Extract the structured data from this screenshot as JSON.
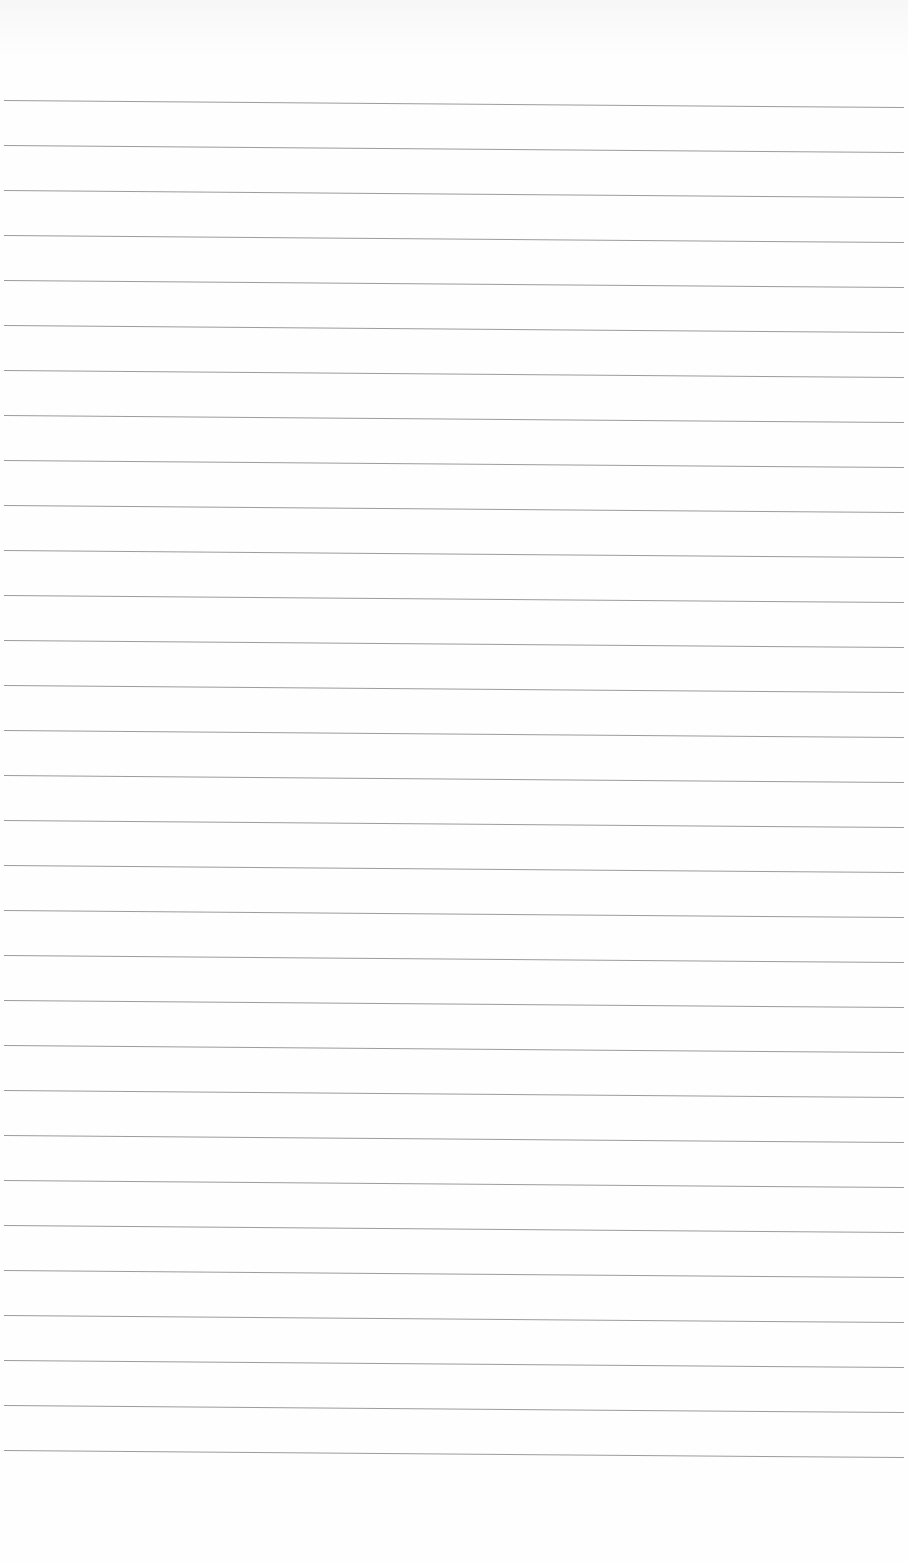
{
  "document": {
    "type": "blank lined paper",
    "rule_count": 31,
    "first_rule_y": 100,
    "rule_spacing": 45,
    "rule_color": "#8a8a8a",
    "paper_color": "#fefefe"
  }
}
